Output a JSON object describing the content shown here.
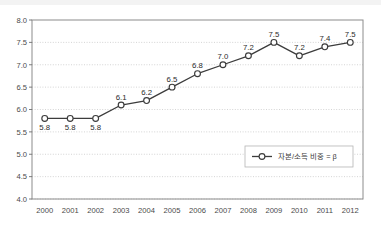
{
  "chart_data": {
    "type": "line",
    "title": "",
    "subtitle": "",
    "xlabel": "",
    "ylabel": "",
    "categories": [
      "2000",
      "2001",
      "2002",
      "2003",
      "2004",
      "2005",
      "2006",
      "2007",
      "2008",
      "2009",
      "2010",
      "2011",
      "2012"
    ],
    "series": [
      {
        "name": "자본/소득 비중 = β",
        "values": [
          5.8,
          5.8,
          5.8,
          6.1,
          6.2,
          6.5,
          6.8,
          7.0,
          7.2,
          7.5,
          7.2,
          7.4,
          7.5
        ],
        "point_labels": [
          "5.8",
          "5.8",
          "5.8",
          "6.1",
          "6.2",
          "6.5",
          "6.8",
          "7.0",
          "7.2",
          "7.5",
          "7.2",
          "7.4",
          "7.5"
        ],
        "label_positions": [
          "below",
          "below",
          "below",
          "above",
          "above",
          "above",
          "above",
          "above",
          "above",
          "above",
          "above",
          "above",
          "above"
        ],
        "marker": "open-circle",
        "line_color": "#3c3c3c",
        "marker_fill": "#ffffff"
      }
    ],
    "ylim": [
      4.0,
      8.0
    ],
    "ytick_step": 0.5,
    "ytick_labels": [
      "8.0",
      "7.5",
      "7.0",
      "6.5",
      "6.0",
      "5.5",
      "5.0",
      "4.5",
      "4.0"
    ],
    "ytick_values": [
      8.0,
      7.5,
      7.0,
      6.5,
      6.0,
      5.5,
      5.0,
      4.5,
      4.0
    ],
    "grid": {
      "horizontal": true,
      "vertical": false,
      "style": "dotted",
      "color": "#c9c9c9"
    },
    "legend": {
      "position": "inside-bottom-right",
      "entries": [
        "자본/소득 비중 = β"
      ],
      "box_border_color": "#b5b5b5"
    },
    "plot_border_color": "#8c8c8c",
    "axis_color": "#6e6e6e"
  }
}
